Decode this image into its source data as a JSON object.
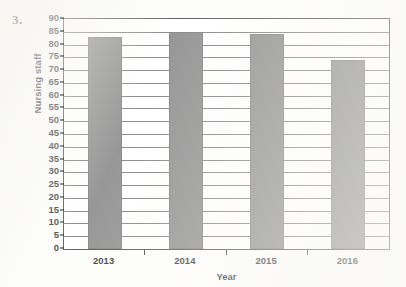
{
  "question": {
    "number": "3."
  },
  "chart_data": {
    "type": "bar",
    "title": "",
    "subtitle": "",
    "xlabel": "Year",
    "ylabel": "Nursing staff",
    "categories": [
      "2013",
      "2014",
      "2015",
      "2016"
    ],
    "values": [
      83,
      85,
      84,
      74
    ],
    "series": [
      {
        "name": "Nursing staff",
        "values": [
          83,
          85,
          84,
          74
        ]
      }
    ],
    "ylim": [
      0,
      90
    ],
    "ytick_step": 5,
    "yticks": [
      0,
      5,
      10,
      15,
      20,
      25,
      30,
      35,
      40,
      45,
      50,
      55,
      60,
      65,
      70,
      75,
      80,
      85,
      90
    ],
    "ytick_labels": [
      "0",
      "5",
      "10",
      "15",
      "20",
      "25",
      "30",
      "35",
      "40",
      "45",
      "50",
      "55",
      "60",
      "65",
      "70",
      "75",
      "80",
      "85",
      "90"
    ],
    "xtick_labels": [
      "2013",
      "2014",
      "2015",
      "2016"
    ],
    "grid": true,
    "grid_axis": "y",
    "legend": false,
    "legend_position": "none",
    "bar_color": "#7d7d7d",
    "bar_edge_color": "#6e6e6e",
    "grid_color": "#6f6f6f",
    "axis_color": "#3b3b3b",
    "background_color": "#ffffff",
    "text_color": "#111111",
    "bar_width_ratio": 0.42
  }
}
